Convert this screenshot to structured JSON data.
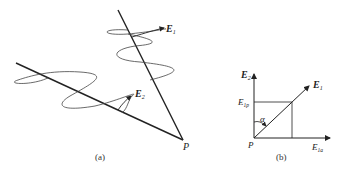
{
  "figure": {
    "panel_a": {
      "caption": "(a)",
      "labels": {
        "e1": "E",
        "e1_sub": "1",
        "e2": "E",
        "e2_sub": "2",
        "point": "P"
      }
    },
    "panel_b": {
      "caption": "(b)",
      "labels": {
        "y_axis": "E",
        "y_axis_sub": "2",
        "x_axis": "E",
        "x_axis_sub": "1a",
        "vector": "E",
        "vector_sub": "1",
        "projection": "E",
        "projection_sub": "1p",
        "angle": "α",
        "origin": "P"
      }
    }
  },
  "colors": {
    "line": "#222222",
    "wave": "#444444",
    "background": "#ffffff"
  }
}
